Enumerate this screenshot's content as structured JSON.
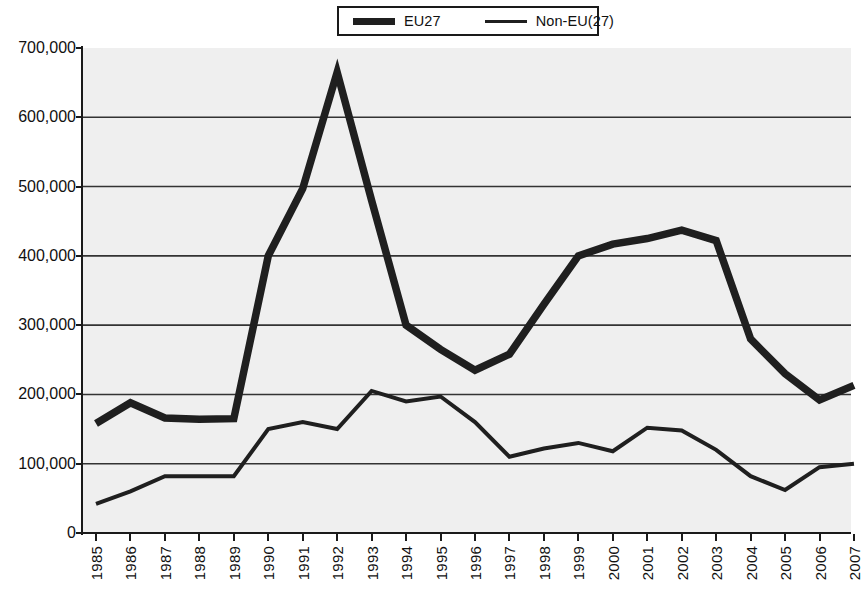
{
  "chart_data": {
    "type": "line",
    "title": "",
    "subtitle": "",
    "xlabel": "",
    "ylabel": "",
    "x": [
      1985,
      1986,
      1987,
      1988,
      1989,
      1990,
      1991,
      1992,
      1993,
      1994,
      1995,
      1996,
      1997,
      1998,
      1999,
      2000,
      2001,
      2002,
      2003,
      2004,
      2005,
      2006,
      2007
    ],
    "categories": [
      "1985",
      "1986",
      "1987",
      "1988",
      "1989",
      "1990",
      "1991",
      "1992",
      "1993",
      "1994",
      "1995",
      "1996",
      "1997",
      "1998",
      "1999",
      "2000",
      "2001",
      "2002",
      "2003",
      "2004",
      "2005",
      "2006",
      "2007"
    ],
    "series": [
      {
        "name": "EU27",
        "style": "thick",
        "color": "#1f1f1f",
        "values": [
          158000,
          188000,
          166000,
          164000,
          165000,
          400000,
          497000,
          665000,
          480000,
          300000,
          265000,
          235000,
          258000,
          330000,
          400000,
          417000,
          425000,
          437000,
          422000,
          280000,
          230000,
          192000,
          213000
        ]
      },
      {
        "name": "Non-EU(27)",
        "style": "thin",
        "color": "#1f1f1f",
        "values": [
          42000,
          60000,
          82000,
          82000,
          82000,
          150000,
          160000,
          150000,
          205000,
          190000,
          197000,
          160000,
          110000,
          122000,
          130000,
          118000,
          152000,
          148000,
          120000,
          82000,
          62000,
          95000,
          100000
        ]
      }
    ],
    "ylim": [
      0,
      700000
    ],
    "xlim": [
      1985,
      2007
    ],
    "y_ticks": [
      0,
      100000,
      200000,
      300000,
      400000,
      500000,
      600000,
      700000
    ],
    "y_tick_labels": [
      "0",
      "100,000",
      "200,000",
      "300,000",
      "400,000",
      "500,000",
      "600,000",
      "700,000"
    ],
    "grid": "horizontal",
    "legend_position": "top-center",
    "plot_background": "#efefef",
    "axis_color": "#1a1a1a",
    "gridline_color": "#333333"
  },
  "legend": {
    "entries": [
      {
        "label": "EU27"
      },
      {
        "label": "Non-EU(27)"
      }
    ]
  }
}
